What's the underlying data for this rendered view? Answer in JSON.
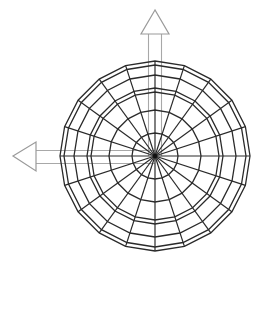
{
  "diagram": {
    "sphere": {
      "center": [
        155,
        156
      ],
      "segments": 20,
      "ring_radii": [
        23,
        46,
        64,
        68,
        81,
        91,
        95
      ],
      "stroke_color": "#2a2a2a"
    },
    "axes": [
      {
        "name": "up-axis",
        "direction": "up",
        "color": "#9a9a9a"
      },
      {
        "name": "left-axis",
        "direction": "left",
        "color": "#9a9a9a"
      }
    ],
    "background": "#ffffff"
  }
}
